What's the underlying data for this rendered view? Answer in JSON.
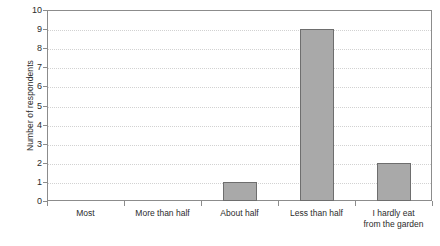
{
  "chart_data": {
    "type": "bar",
    "title": "",
    "subtitle": "",
    "xlabel": "",
    "ylabel": "Number of respondents",
    "categories": [
      "Most",
      "More than half",
      "About half",
      "Less than half",
      "I hardly eat from the garden"
    ],
    "category_lines": [
      [
        "Most"
      ],
      [
        "More than half"
      ],
      [
        "About half"
      ],
      [
        "Less than half"
      ],
      [
        "I hardly eat",
        "from the garden"
      ]
    ],
    "values": [
      0,
      0,
      1,
      9,
      2
    ],
    "ylim": [
      0,
      10
    ],
    "ytick_labels": [
      "0",
      "1",
      "2",
      "3",
      "4",
      "5",
      "6",
      "7",
      "8",
      "9",
      "10"
    ],
    "ytick_values": [
      0,
      1,
      2,
      3,
      4,
      5,
      6,
      7,
      8,
      9,
      10
    ],
    "grid": true,
    "grid_axis": "y",
    "legend": false,
    "legend_position": "none",
    "colors": {
      "bar_fill": "#a9a9a9",
      "bar_border": "#6e6e6e",
      "gridline": "#d2d2d2",
      "axis": "#8c8c8c",
      "text": "#2b2b2b",
      "background": "#ffffff"
    }
  }
}
